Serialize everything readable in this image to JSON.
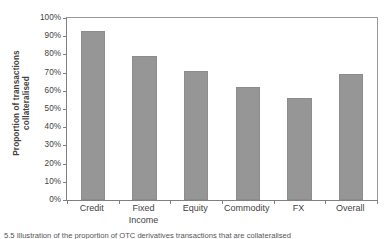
{
  "chart_data": {
    "type": "bar",
    "title": "",
    "subtitle": "",
    "xlabel": "",
    "ylabel": "Proportion of transactions collateralised",
    "ylabel_line1": "Proportion of transactions",
    "ylabel_line2": "collateralised",
    "categories": [
      "Credit",
      "Fixed Income",
      "Equity",
      "Commodity",
      "FX",
      "Overall"
    ],
    "category_lines": [
      [
        "Credit"
      ],
      [
        "Fixed",
        "Income"
      ],
      [
        "Equity"
      ],
      [
        "Commodity"
      ],
      [
        "FX"
      ],
      [
        "Overall"
      ]
    ],
    "values": [
      93,
      79,
      71,
      62,
      56,
      69
    ],
    "value_labels": [
      "93%",
      "79%",
      "71%",
      "62%",
      "56%",
      "69%"
    ],
    "ylim": [
      0,
      100
    ],
    "ytick_values": [
      0,
      10,
      20,
      30,
      40,
      50,
      60,
      70,
      80,
      90,
      100
    ],
    "ytick_labels": [
      "0%",
      "10%",
      "20%",
      "30%",
      "40%",
      "50%",
      "60%",
      "70%",
      "80%",
      "90%",
      "100%"
    ],
    "grid": false,
    "legend": null,
    "legend_position": "none",
    "series": [
      {
        "name": "Proportion of transactions collateralised",
        "values": [
          93,
          79,
          71,
          62,
          56,
          69
        ]
      }
    ],
    "colors": {
      "bar_fill": "#969696",
      "bar_border": "#8c8c8c",
      "axis": "#808080",
      "text": "#3f3f3f",
      "background": "#ffffff"
    }
  },
  "caption": {
    "text": "5.5   Illustration of the proportion of OTC derivatives transactions that are collateralised"
  }
}
